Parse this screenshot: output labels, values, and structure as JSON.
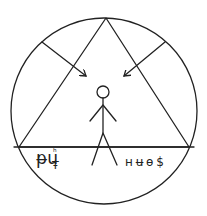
{
  "diagram": {
    "colors": {
      "line": "#222222",
      "background": "#ffffff"
    },
    "circle": {
      "cx": 104,
      "cy": 111,
      "r": 93
    },
    "triangle": {
      "apex": [
        106,
        18
      ],
      "left": [
        19,
        147
      ],
      "right": [
        189,
        147
      ]
    },
    "baseline_y": 147,
    "arrows": [
      {
        "name": "left-arrow",
        "from": [
          42,
          42
        ],
        "to": [
          86,
          76
        ]
      },
      {
        "name": "right-arrow",
        "from": [
          165,
          42
        ],
        "to": [
          124,
          76
        ]
      }
    ],
    "figure": {
      "head": [
        103,
        92,
        6
      ]
    },
    "labels": {
      "left_main": "ᵽu",
      "left_sup": "ʰ",
      "left_sub": "Ŧ",
      "right": "ʜ ʉ ɵ $"
    }
  }
}
